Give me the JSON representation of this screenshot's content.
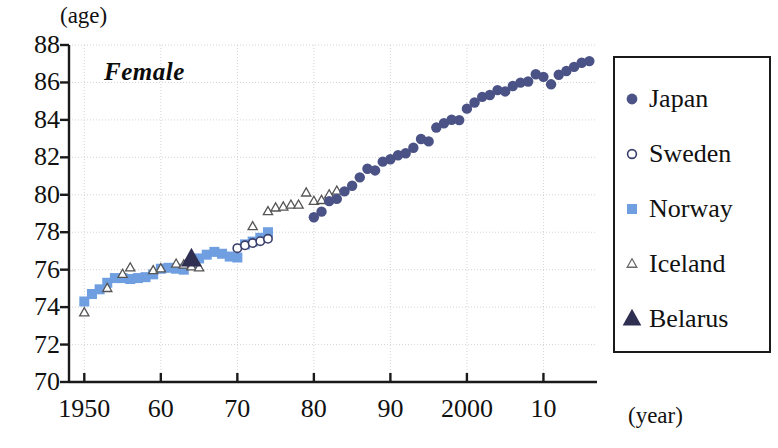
{
  "chart_data": {
    "type": "scatter",
    "title": "",
    "annotation": "Female",
    "xlabel": "(year)",
    "ylabel": "(age)",
    "xlim": [
      1948,
      2017
    ],
    "ylim": [
      70,
      88
    ],
    "yticks": [
      88,
      86,
      84,
      82,
      80,
      78,
      76,
      74,
      72,
      70
    ],
    "xticks": [
      1950,
      1960,
      1970,
      1980,
      1990,
      2000,
      2010
    ],
    "xtick_labels": [
      "1950",
      "60",
      "70",
      "80",
      "90",
      "2000",
      "10"
    ],
    "grid": true,
    "legend_position": "right-outside",
    "series": [
      {
        "name": "Japan",
        "marker": "filled-circle",
        "color": "#4a5286",
        "points": [
          [
            1980,
            78.8
          ],
          [
            1981,
            79.1
          ],
          [
            1982,
            79.66
          ],
          [
            1983,
            79.78
          ],
          [
            1984,
            80.18
          ],
          [
            1985,
            80.48
          ],
          [
            1986,
            80.93
          ],
          [
            1987,
            81.39
          ],
          [
            1988,
            81.3
          ],
          [
            1989,
            81.77
          ],
          [
            1990,
            81.9
          ],
          [
            1991,
            82.11
          ],
          [
            1992,
            82.22
          ],
          [
            1993,
            82.51
          ],
          [
            1994,
            82.98
          ],
          [
            1995,
            82.85
          ],
          [
            1996,
            83.59
          ],
          [
            1997,
            83.82
          ],
          [
            1998,
            84.01
          ],
          [
            1999,
            83.99
          ],
          [
            2000,
            84.6
          ],
          [
            2001,
            84.93
          ],
          [
            2002,
            85.23
          ],
          [
            2003,
            85.33
          ],
          [
            2004,
            85.59
          ],
          [
            2005,
            85.52
          ],
          [
            2006,
            85.81
          ],
          [
            2007,
            85.99
          ],
          [
            2008,
            86.05
          ],
          [
            2009,
            86.44
          ],
          [
            2010,
            86.3
          ],
          [
            2011,
            85.9
          ],
          [
            2012,
            86.41
          ],
          [
            2013,
            86.61
          ],
          [
            2014,
            86.83
          ],
          [
            2015,
            87.05
          ],
          [
            2016,
            87.14
          ]
        ]
      },
      {
        "name": "Sweden",
        "marker": "open-circle",
        "color": "#3a3f6b",
        "points": [
          [
            1970,
            77.15
          ],
          [
            1971,
            77.3
          ],
          [
            1972,
            77.42
          ],
          [
            1973,
            77.52
          ],
          [
            1974,
            77.65
          ]
        ]
      },
      {
        "name": "Norway",
        "marker": "filled-square",
        "color": "#6f9fe0",
        "points": [
          [
            1950,
            74.3
          ],
          [
            1951,
            74.7
          ],
          [
            1952,
            74.95
          ],
          [
            1953,
            75.3
          ],
          [
            1954,
            75.55
          ],
          [
            1955,
            75.55
          ],
          [
            1956,
            75.5
          ],
          [
            1957,
            75.55
          ],
          [
            1958,
            75.6
          ],
          [
            1959,
            75.75
          ],
          [
            1960,
            76.05
          ],
          [
            1961,
            76.1
          ],
          [
            1962,
            76.05
          ],
          [
            1963,
            76.0
          ],
          [
            1964,
            76.25
          ],
          [
            1965,
            76.6
          ],
          [
            1966,
            76.8
          ],
          [
            1967,
            76.95
          ],
          [
            1968,
            76.85
          ],
          [
            1969,
            76.7
          ],
          [
            1970,
            76.65
          ],
          [
            1971,
            77.35
          ],
          [
            1972,
            77.5
          ],
          [
            1973,
            77.7
          ],
          [
            1974,
            78.0
          ]
        ]
      },
      {
        "name": "Iceland",
        "marker": "open-triangle",
        "color": "#555555",
        "points": [
          [
            1950,
            73.7
          ],
          [
            1953,
            75.0
          ],
          [
            1955,
            75.75
          ],
          [
            1956,
            76.1
          ],
          [
            1959,
            75.95
          ],
          [
            1960,
            76.05
          ],
          [
            1962,
            76.3
          ],
          [
            1963,
            76.25
          ],
          [
            1964,
            76.15
          ],
          [
            1965,
            76.1
          ],
          [
            1972,
            78.3
          ],
          [
            1974,
            79.1
          ],
          [
            1975,
            79.3
          ],
          [
            1976,
            79.35
          ],
          [
            1977,
            79.45
          ],
          [
            1978,
            79.45
          ],
          [
            1979,
            80.1
          ],
          [
            1980,
            79.65
          ],
          [
            1981,
            79.7
          ],
          [
            1982,
            80.0
          ],
          [
            1983,
            80.2
          ]
        ]
      },
      {
        "name": "Belarus",
        "marker": "filled-triangle",
        "color": "#2f2f52",
        "points": [
          [
            1964,
            76.55
          ]
        ]
      }
    ]
  },
  "legend": {
    "items": [
      {
        "label": "Japan",
        "marker": "filled-circle",
        "color": "#4a5286"
      },
      {
        "label": "Sweden",
        "marker": "open-circle",
        "color": "#3a3f6b"
      },
      {
        "label": "Norway",
        "marker": "filled-square",
        "color": "#6f9fe0"
      },
      {
        "label": "Iceland",
        "marker": "open-triangle",
        "color": "#6a6a6a"
      },
      {
        "label": "Belarus",
        "marker": "filled-triangle",
        "color": "#2f2f52"
      }
    ]
  }
}
